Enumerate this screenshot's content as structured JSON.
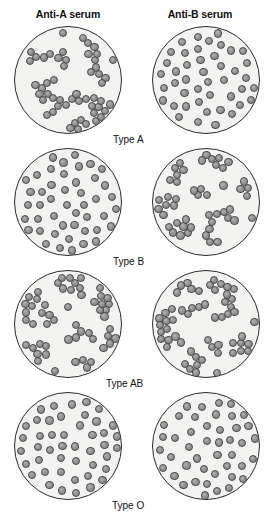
{
  "figure": {
    "columns": [
      {
        "id": "anti-a",
        "label": "Anti-A serum"
      },
      {
        "id": "anti-b",
        "label": "Anti-B serum"
      }
    ],
    "rows": [
      {
        "id": "type-a",
        "label": "Type A",
        "label_x": 113,
        "label_y": 108,
        "wells": [
          {
            "column": "anti-a",
            "reaction": "agglutinated",
            "description": "clumped cells"
          },
          {
            "column": "anti-b",
            "reaction": "not-agglutinated",
            "description": "evenly dispersed cells"
          }
        ]
      },
      {
        "id": "type-b",
        "label": "Type B",
        "label_x": 113,
        "label_y": 108,
        "wells": [
          {
            "column": "anti-a",
            "reaction": "not-agglutinated",
            "description": "evenly dispersed cells"
          },
          {
            "column": "anti-b",
            "reaction": "agglutinated",
            "description": "clumped cells"
          }
        ]
      },
      {
        "id": "type-ab",
        "label": "Type AB",
        "label_x": 106,
        "label_y": 108,
        "wells": [
          {
            "column": "anti-a",
            "reaction": "agglutinated",
            "description": "clumped cells"
          },
          {
            "column": "anti-b",
            "reaction": "agglutinated",
            "description": "clumped cells"
          }
        ]
      },
      {
        "id": "type-o",
        "label": "Type O",
        "label_x": 112,
        "label_y": 108,
        "wells": [
          {
            "column": "anti-a",
            "reaction": "not-agglutinated",
            "description": "evenly dispersed cells"
          },
          {
            "column": "anti-b",
            "reaction": "not-agglutinated",
            "description": "evenly dispersed cells"
          }
        ]
      }
    ],
    "colors": {
      "cell_fill": "#8f8f8f",
      "cell_outline": "#4a4a4a",
      "well_fill": "#f3f3f1",
      "well_outline": "#2b2b2b",
      "text": "#111111",
      "background": "#ffffff"
    },
    "geometry": {
      "well_diameter": 108,
      "well_left_x": 14,
      "well_right_x": 152,
      "row_tops": [
        26,
        148,
        270,
        392
      ],
      "cell_diameter": 8.2
    }
  }
}
